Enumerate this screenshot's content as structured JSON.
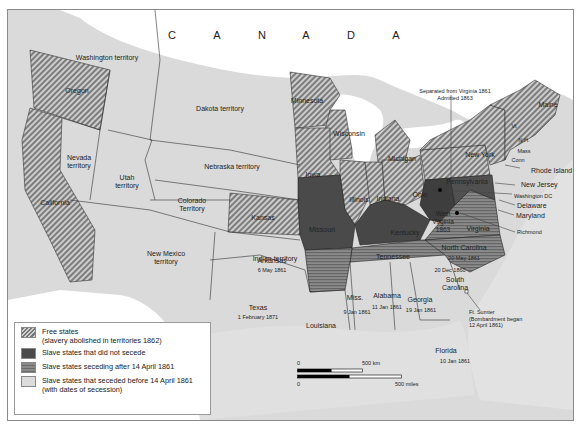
{
  "map": {
    "country_label": [
      "C",
      "A",
      "N",
      "A",
      "D",
      "A"
    ],
    "regions": {
      "washington": "Washington territory",
      "oregon": "Oregon",
      "california": "California",
      "nevada": "Nevada\nterritory",
      "utah": "Utah\nterritory",
      "dakota": "Dakota territory",
      "nebraska": "Nebraska territory",
      "colorado": "Colorado\nTerritory",
      "kansas": "Kansas",
      "new_mexico": "New Mexico\nterritory",
      "indian": "Indian territory",
      "texas": "Texas",
      "texas_date": "1 February 1871",
      "minnesota": "Minnesota",
      "wisconsin": "Wisconsin",
      "iowa": "Iowa",
      "illinois": "Illinois",
      "indiana": "Indiana",
      "michigan": "Michigan",
      "ohio": "Ohio",
      "missouri": "Missouri",
      "kentucky": "Kentucky",
      "west_virginia": "West\nVirginia\n1863",
      "virginia": "Virginia",
      "arkansas": "Arkansas",
      "arkansas_date": "6 May 1861",
      "tennessee": "Tennessee",
      "north_carolina": "North Carolina",
      "north_carolina_date": "20 May 1861",
      "south_carolina": "South\nCarolina",
      "south_carolina_date": "20 Dec 1860",
      "mississippi": "Miss.",
      "mississippi_date": "9 Jan 1861",
      "alabama": "Alabama",
      "alabama_date": "11 Jan 1861",
      "georgia": "Georgia",
      "georgia_date": "19 Jan 1861",
      "louisiana": "Louisiana",
      "florida": "Florida",
      "florida_date": "10 Jan 1861",
      "pennsylvania": "Pennsylvania",
      "new_york": "New York",
      "maine": "Maine",
      "vermont": "Vt",
      "new_hampshire": "N.H.",
      "massachusetts": "Mass",
      "connecticut": "Conn"
    },
    "callouts": {
      "west_virginia_note": "Separated from Virginia 1861\nAdmitted 1863",
      "rhode_island": "Rhode Island",
      "new_jersey": "New Jersey",
      "washington_dc": "Washington DC",
      "delaware": "Delaware",
      "maryland": "Maryland",
      "richmond": "Richmond",
      "fort_sumter": "Ft. Sumter\n(Bombardment began\n12 April 1861)"
    }
  },
  "legend": {
    "items": [
      {
        "key": "free",
        "label": "Free states\n(slavery abolished in territories 1862)"
      },
      {
        "key": "noseceed",
        "label": "Slave states that did not secede"
      },
      {
        "key": "after",
        "label": "Slave states seceding after 14 April 1861"
      },
      {
        "key": "before",
        "label": "Slave states that seceded before 14 April 1861\n(with dates of secession)"
      }
    ]
  },
  "scale_bar": {
    "km_zero": "0",
    "km_label": "500 km",
    "miles_zero": "0",
    "miles_label": "500 miles"
  },
  "colors": {
    "free_stripe_dark": "#777777",
    "free_stripe_light": "#cfcfcf",
    "no_secede": "#4a4a4a",
    "seceded_after": "#7a7a7a",
    "seceded_before": "#dcdcdc",
    "territory": "#d6d6d6",
    "water": "#ffffff"
  }
}
